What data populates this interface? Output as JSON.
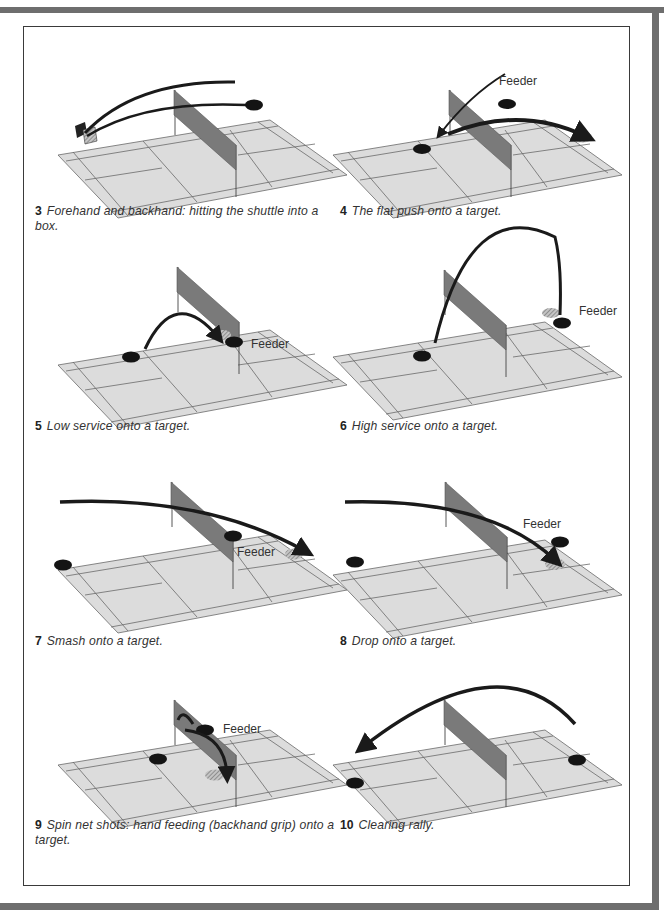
{
  "page": {
    "colors": {
      "outer_border": "#6e6e6e",
      "frame_border": "#3a3a3a",
      "court_fill": "#dcdcdc",
      "court_lines": "#5a5a5a",
      "net_fill": "#7a7a7a",
      "trajectory": "#1a1a1a",
      "target": "#141414",
      "landing_hatch": "#9a9a9a"
    }
  },
  "figures": [
    {
      "id": "3",
      "number": "3",
      "caption": "Forehand and backhand: hitting the shuttle into a box.",
      "feeder_label": "",
      "elements": [
        "box-target",
        "player-spot-far-right",
        "two-arc-trajectories"
      ]
    },
    {
      "id": "4",
      "number": "4",
      "caption": "The flat push onto a target.",
      "feeder_label": "Feeder",
      "elements": [
        "feeder-arrow",
        "flat-push-arrow",
        "target-spot",
        "landing-zone"
      ]
    },
    {
      "id": "5",
      "number": "5",
      "caption": "Low service onto a target.",
      "feeder_label": "Feeder",
      "elements": [
        "low-serve-arc",
        "server-spot",
        "feeder-spot",
        "landing-zone"
      ]
    },
    {
      "id": "6",
      "number": "6",
      "caption": "High service onto a target.",
      "feeder_label": "Feeder",
      "elements": [
        "high-serve-arc",
        "server-spot",
        "feeder-spot",
        "landing-zone"
      ]
    },
    {
      "id": "7",
      "number": "7",
      "caption": "Smash onto a target.",
      "feeder_label": "Feeder",
      "elements": [
        "smash-trajectory",
        "player-spot",
        "feeder-spot",
        "landing-zone"
      ]
    },
    {
      "id": "8",
      "number": "8",
      "caption": "Drop onto a target.",
      "feeder_label": "Feeder",
      "elements": [
        "drop-trajectory",
        "player-spot",
        "feeder-spot",
        "landing-zone"
      ]
    },
    {
      "id": "9",
      "number": "9",
      "caption": "Spin net shots: hand feeding (backhand grip) onto a target.",
      "feeder_label": "Feeder",
      "elements": [
        "spin-net-shot",
        "player-spot",
        "feeder-spot",
        "landing-zone"
      ]
    },
    {
      "id": "10",
      "number": "10",
      "caption": "Clearing rally.",
      "feeder_label": "",
      "elements": [
        "clear-arc",
        "player-spot-left",
        "player-spot-right"
      ]
    }
  ]
}
